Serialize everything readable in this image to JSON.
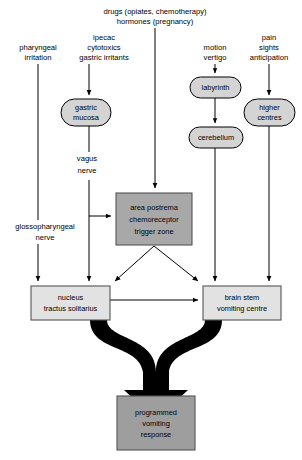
{
  "diagram": {
    "canvas": {
      "width": 302,
      "height": 460,
      "background": "#ffffff"
    },
    "colors": {
      "oval_fill": "#d4d4d4",
      "ctz_fill": "#a8a8a8",
      "nts_fill": "#e2e2e2",
      "vomit_centre_fill": "#e2e2e2",
      "response_fill": "#9e9e9e",
      "stroke": "#000000",
      "box_stroke": "#555555",
      "thick_arrow": "#000000"
    },
    "stimulus_labels": [
      {
        "id": "pharyngeal",
        "lines": [
          "pharyngeal",
          "irritation"
        ],
        "x": 38,
        "y": 52
      },
      {
        "id": "ipecac",
        "lines": [
          "ipecac",
          "cytotoxics",
          "gastric irritants"
        ],
        "x": 104,
        "y": 46
      },
      {
        "id": "drugs",
        "lines": [
          "drugs (opiates, chemotherapy)",
          "hormones (pregnancy)"
        ],
        "x": 155,
        "y": 14
      },
      {
        "id": "motion",
        "lines": [
          "motion",
          "vertigo"
        ],
        "x": 215,
        "y": 52
      },
      {
        "id": "pain",
        "lines": [
          "pain",
          "sights",
          "anticipation"
        ],
        "x": 269,
        "y": 46
      }
    ],
    "nerve_labels": [
      {
        "id": "vagus-nerve",
        "lines": [
          "vagus",
          "nerve"
        ],
        "x": 86,
        "y": 160
      },
      {
        "id": "glossopharyngeal-nerve",
        "lines": [
          "glossopharyngeal",
          "nerve"
        ],
        "x": 45,
        "y": 228
      }
    ],
    "nodes": [
      {
        "id": "gastric-mucosa",
        "shape": "oval",
        "lines": [
          "gastric",
          "mucosa"
        ],
        "x": 61,
        "y": 99,
        "w": 50,
        "h": 27,
        "fill": "#d4d4d4"
      },
      {
        "id": "labyrinth",
        "shape": "oval",
        "lines": [
          "labyrinth"
        ],
        "x": 190,
        "y": 77,
        "w": 51,
        "h": 21,
        "fill": "#d4d4d4"
      },
      {
        "id": "cerebellum",
        "shape": "oval",
        "lines": [
          "cerebellum"
        ],
        "x": 189,
        "y": 127,
        "w": 54,
        "h": 21,
        "fill": "#d4d4d4"
      },
      {
        "id": "higher-centres",
        "shape": "oval",
        "lines": [
          "higher",
          "centres"
        ],
        "x": 244,
        "y": 99,
        "w": 51,
        "h": 27,
        "fill": "#d4d4d4"
      },
      {
        "id": "area-postrema-ctz",
        "shape": "box",
        "lines": [
          "area postrema",
          "chemoreceptor",
          "trigger zone"
        ],
        "x": 116,
        "y": 193,
        "w": 76,
        "h": 52,
        "fill": "#a8a8a8"
      },
      {
        "id": "nucleus-tractus-solitarius",
        "shape": "box",
        "lines": [
          "nucleus",
          "tractus solitarius"
        ],
        "x": 31,
        "y": 286,
        "w": 79,
        "h": 34,
        "fill": "#e2e2e2"
      },
      {
        "id": "brain-stem-vomiting-centre",
        "shape": "box",
        "lines": [
          "brain stem",
          "vomiting centre"
        ],
        "x": 203,
        "y": 286,
        "w": 78,
        "h": 34,
        "fill": "#e2e2e2"
      },
      {
        "id": "programmed-vomiting-response",
        "shape": "box",
        "lines": [
          "programmed",
          "vomiting",
          "response"
        ],
        "x": 117,
        "y": 396,
        "w": 78,
        "h": 54,
        "fill": "#9e9e9e"
      }
    ],
    "connections": [
      {
        "id": "pharyngeal-to-nts",
        "from": "pharyngeal",
        "to": "nucleus-tractus-solitarius",
        "style": "thin-arrow"
      },
      {
        "id": "ipecac-to-gastric-mucosa",
        "from": "ipecac",
        "to": "gastric-mucosa",
        "style": "thin-arrow"
      },
      {
        "id": "gastric-mucosa-to-vagus",
        "from": "gastric-mucosa",
        "to": "vagus-nerve",
        "style": "line"
      },
      {
        "id": "vagus-to-ctz",
        "from": "vagus-nerve",
        "to": "area-postrema-ctz",
        "style": "thin-arrow"
      },
      {
        "id": "vagus-to-nts",
        "from": "vagus-nerve",
        "to": "nucleus-tractus-solitarius",
        "style": "thin-arrow"
      },
      {
        "id": "drugs-to-ctz",
        "from": "drugs",
        "to": "area-postrema-ctz",
        "style": "thin-arrow"
      },
      {
        "id": "motion-to-labyrinth",
        "from": "motion",
        "to": "labyrinth",
        "style": "thin-arrow"
      },
      {
        "id": "labyrinth-to-cerebellum",
        "from": "labyrinth",
        "to": "cerebellum",
        "style": "thin-arrow"
      },
      {
        "id": "cerebellum-to-vomiting-centre",
        "from": "cerebellum",
        "to": "brain-stem-vomiting-centre",
        "style": "thin-arrow"
      },
      {
        "id": "pain-to-higher-centres",
        "from": "pain",
        "to": "higher-centres",
        "style": "thin-arrow"
      },
      {
        "id": "higher-centres-to-vomiting-centre",
        "from": "higher-centres",
        "to": "brain-stem-vomiting-centre",
        "style": "thin-arrow"
      },
      {
        "id": "ctz-to-nts",
        "from": "area-postrema-ctz",
        "to": "nucleus-tractus-solitarius",
        "style": "thin-arrow"
      },
      {
        "id": "ctz-to-vomiting-centre",
        "from": "area-postrema-ctz",
        "to": "brain-stem-vomiting-centre",
        "style": "thin-arrow"
      },
      {
        "id": "nts-to-vomiting-centre",
        "from": "nucleus-tractus-solitarius",
        "to": "brain-stem-vomiting-centre",
        "style": "thin-arrow"
      },
      {
        "id": "merge-to-response",
        "from": [
          "nucleus-tractus-solitarius",
          "brain-stem-vomiting-centre"
        ],
        "to": "programmed-vomiting-response",
        "style": "thick-merge-arrow"
      }
    ]
  }
}
